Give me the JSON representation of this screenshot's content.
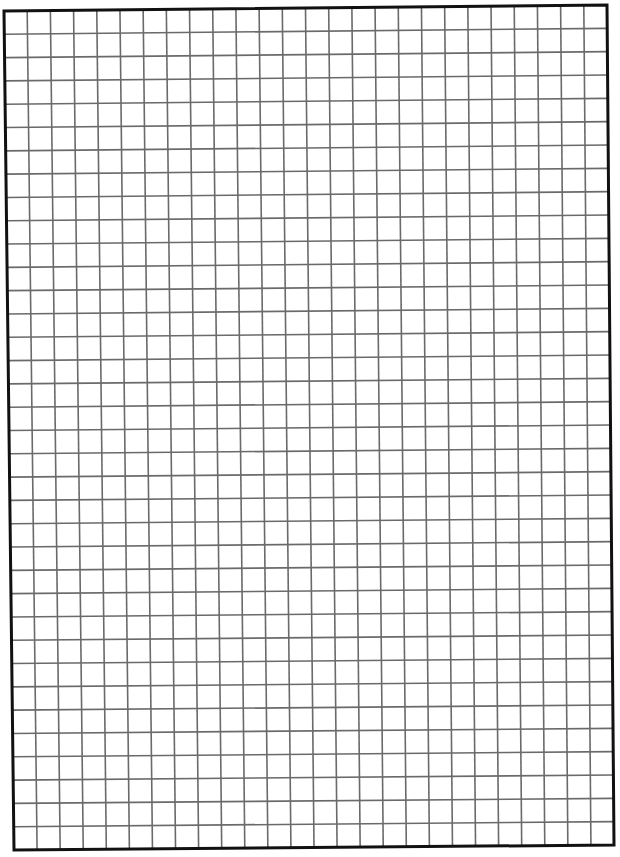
{
  "page": {
    "width": 620,
    "height": 857,
    "background": "#ffffff"
  },
  "grid_paper": {
    "columns": 26,
    "rows": 36,
    "corners": {
      "top_left": [
        4,
        11
      ],
      "top_right": [
        607,
        5
      ],
      "bottom_right": [
        614,
        845
      ],
      "bottom_left": [
        14,
        850
      ]
    },
    "border_color": "#111111",
    "border_width": 3,
    "grid_line_color": "#6a6a6a",
    "grid_line_width": 1.6
  }
}
